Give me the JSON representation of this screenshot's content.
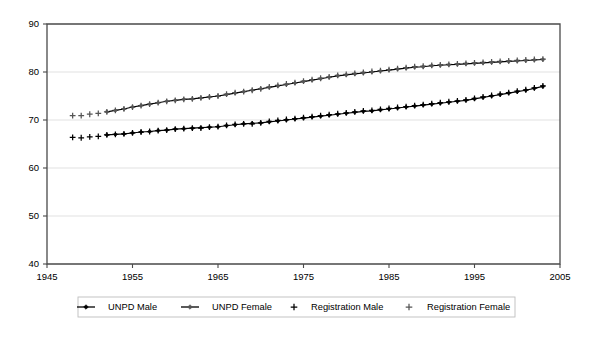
{
  "chart_data": {
    "type": "line",
    "title": "",
    "xlabel": "",
    "ylabel": "",
    "xlim": [
      1945,
      2005
    ],
    "ylim": [
      40,
      90
    ],
    "xticks": [
      1945,
      1955,
      1965,
      1975,
      1985,
      1995,
      2005
    ],
    "yticks": [
      40,
      50,
      60,
      70,
      80,
      90
    ],
    "grid": true,
    "legend_position": "bottom",
    "legend": [
      "UNPD Male",
      "UNPD Female",
      "Registration Male",
      "Registration Female"
    ],
    "series": [
      {
        "name": "UNPD Male",
        "marker": "diamond",
        "line": true,
        "color": "#000000",
        "x": [
          1952,
          1953,
          1954,
          1955,
          1956,
          1957,
          1958,
          1959,
          1960,
          1961,
          1962,
          1963,
          1964,
          1965,
          1966,
          1967,
          1968,
          1969,
          1970,
          1971,
          1972,
          1973,
          1974,
          1975,
          1976,
          1977,
          1978,
          1979,
          1980,
          1981,
          1982,
          1983,
          1984,
          1985,
          1986,
          1987,
          1988,
          1989,
          1990,
          1991,
          1992,
          1993,
          1994,
          1995,
          1996,
          1997,
          1998,
          1999,
          2000,
          2001,
          2002,
          2003
        ],
        "values": [
          66.9,
          67.0,
          67.1,
          67.3,
          67.5,
          67.6,
          67.8,
          67.9,
          68.1,
          68.2,
          68.3,
          68.4,
          68.5,
          68.6,
          68.8,
          69.0,
          69.2,
          69.3,
          69.4,
          69.6,
          69.8,
          70.0,
          70.2,
          70.4,
          70.6,
          70.8,
          71.0,
          71.2,
          71.4,
          71.6,
          71.8,
          71.9,
          72.1,
          72.3,
          72.5,
          72.7,
          72.9,
          73.1,
          73.3,
          73.5,
          73.7,
          73.9,
          74.1,
          74.4,
          74.7,
          75.0,
          75.3,
          75.6,
          75.9,
          76.2,
          76.6,
          77.0
        ]
      },
      {
        "name": "UNPD Female",
        "marker": "diamond",
        "line": true,
        "color": "#555555",
        "x": [
          1952,
          1953,
          1954,
          1955,
          1956,
          1957,
          1958,
          1959,
          1960,
          1961,
          1962,
          1963,
          1964,
          1965,
          1966,
          1967,
          1968,
          1969,
          1970,
          1971,
          1972,
          1973,
          1974,
          1975,
          1976,
          1977,
          1978,
          1979,
          1980,
          1981,
          1982,
          1983,
          1984,
          1985,
          1986,
          1987,
          1988,
          1989,
          1990,
          1991,
          1992,
          1993,
          1994,
          1995,
          1996,
          1997,
          1998,
          1999,
          2000,
          2001,
          2002,
          2003
        ],
        "values": [
          71.7,
          72.0,
          72.3,
          72.7,
          73.0,
          73.3,
          73.6,
          73.9,
          74.1,
          74.3,
          74.4,
          74.6,
          74.8,
          75.0,
          75.3,
          75.6,
          75.9,
          76.2,
          76.5,
          76.8,
          77.1,
          77.4,
          77.7,
          78.0,
          78.3,
          78.6,
          78.9,
          79.2,
          79.4,
          79.6,
          79.8,
          80.0,
          80.2,
          80.4,
          80.6,
          80.8,
          81.0,
          81.1,
          81.3,
          81.4,
          81.5,
          81.6,
          81.7,
          81.8,
          81.9,
          82.0,
          82.1,
          82.2,
          82.3,
          82.4,
          82.5,
          82.6
        ]
      },
      {
        "name": "Registration Male",
        "marker": "plus",
        "line": false,
        "color": "#000000",
        "x": [
          1948,
          1949,
          1950,
          1951,
          1952,
          1953,
          1954,
          1955,
          1956,
          1957,
          1958,
          1959,
          1960,
          1961,
          1962,
          1963,
          1964,
          1965,
          1966,
          1967,
          1968,
          1969,
          1970,
          1971,
          1972,
          1973,
          1974,
          1975,
          1976,
          1977,
          1978,
          1979,
          1980,
          1981,
          1982,
          1983,
          1984,
          1985,
          1986,
          1987,
          1988,
          1989,
          1990,
          1991,
          1992,
          1993,
          1994,
          1995,
          1996,
          1997,
          1998,
          1999,
          2000,
          2001,
          2002,
          2003
        ],
        "values": [
          66.4,
          66.3,
          66.5,
          66.6,
          66.9,
          67.0,
          67.1,
          67.3,
          67.5,
          67.6,
          67.8,
          67.9,
          68.1,
          68.2,
          68.3,
          68.3,
          68.5,
          68.6,
          68.9,
          69.1,
          69.2,
          69.2,
          69.4,
          69.7,
          69.9,
          70.1,
          70.3,
          70.5,
          70.7,
          70.9,
          71.1,
          71.3,
          71.5,
          71.7,
          71.9,
          72.0,
          72.2,
          72.4,
          72.6,
          72.8,
          73.0,
          73.2,
          73.4,
          73.6,
          73.8,
          74.0,
          74.2,
          74.5,
          74.8,
          75.1,
          75.4,
          75.7,
          76.0,
          76.3,
          76.7,
          77.1
        ]
      },
      {
        "name": "Registration Female",
        "marker": "plus",
        "line": false,
        "color": "#555555",
        "x": [
          1948,
          1949,
          1950,
          1951,
          1952,
          1953,
          1954,
          1955,
          1956,
          1957,
          1958,
          1959,
          1960,
          1961,
          1962,
          1963,
          1964,
          1965,
          1966,
          1967,
          1968,
          1969,
          1970,
          1971,
          1972,
          1973,
          1974,
          1975,
          1976,
          1977,
          1978,
          1979,
          1980,
          1981,
          1982,
          1983,
          1984,
          1985,
          1986,
          1987,
          1988,
          1989,
          1990,
          1991,
          1992,
          1993,
          1994,
          1995,
          1996,
          1997,
          1998,
          1999,
          2000,
          2001,
          2002,
          2003
        ],
        "values": [
          70.9,
          70.9,
          71.2,
          71.4,
          71.7,
          72.0,
          72.3,
          72.7,
          73.0,
          73.3,
          73.6,
          73.9,
          74.1,
          74.3,
          74.4,
          74.6,
          74.8,
          75.0,
          75.4,
          75.7,
          75.9,
          76.2,
          76.5,
          76.9,
          77.2,
          77.5,
          77.8,
          78.1,
          78.4,
          78.7,
          79.0,
          79.3,
          79.5,
          79.7,
          79.9,
          80.1,
          80.3,
          80.5,
          80.7,
          80.9,
          81.1,
          81.2,
          81.4,
          81.5,
          81.6,
          81.7,
          81.8,
          81.9,
          82.0,
          82.1,
          82.2,
          82.3,
          82.4,
          82.5,
          82.6,
          82.7
        ]
      }
    ]
  },
  "legend": {
    "items": [
      {
        "label": "UNPD Male",
        "marker": "line-diamond",
        "color": "#000000"
      },
      {
        "label": "UNPD Female",
        "marker": "line-diamond",
        "color": "#555555"
      },
      {
        "label": "Registration Male",
        "marker": "plus",
        "color": "#000000"
      },
      {
        "label": "Registration Female",
        "marker": "plus",
        "color": "#555555"
      }
    ]
  },
  "axes": {
    "y_tick_labels": [
      "90",
      "80",
      "70",
      "60",
      "50",
      "40"
    ],
    "x_tick_labels": [
      "1945",
      "1955",
      "1965",
      "1975",
      "1985",
      "1995",
      "2005"
    ]
  }
}
